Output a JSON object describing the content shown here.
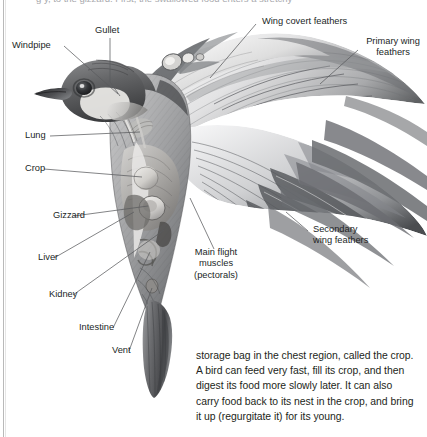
{
  "page": {
    "clipped_top_line": "g                y,                to the gizzard. First, the swallowed food enters a stretchy",
    "background_color": "#ffffff",
    "text_color": "#231f20"
  },
  "figure": {
    "name": "bird-internal-anatomy-diagram",
    "style": "pencil / graphite shaded scientific illustration, greyscale"
  },
  "labels": [
    {
      "id": "windpipe",
      "text": "Windpipe",
      "align": "left"
    },
    {
      "id": "gullet",
      "text": "Gullet",
      "align": "left"
    },
    {
      "id": "lung",
      "text": "Lung",
      "align": "left"
    },
    {
      "id": "crop",
      "text": "Crop",
      "align": "left"
    },
    {
      "id": "gizzard",
      "text": "Gizzard",
      "align": "left"
    },
    {
      "id": "liver",
      "text": "Liver",
      "align": "left"
    },
    {
      "id": "kidney",
      "text": "Kidney",
      "align": "left"
    },
    {
      "id": "intestine",
      "text": "Intestine",
      "align": "left"
    },
    {
      "id": "vent",
      "text": "Vent",
      "align": "left"
    },
    {
      "id": "wing-covert",
      "text": "Wing covert feathers",
      "align": "left"
    },
    {
      "id": "primary-wing",
      "text": "Primary wing\nfeathers",
      "align": "center"
    },
    {
      "id": "secondary-wing",
      "text": "Secondary\nwing feathers",
      "align": "left"
    },
    {
      "id": "main-flight",
      "text": "Main flight\nmuscles\n(pectorals)",
      "align": "center"
    }
  ],
  "body_text": {
    "lines": [
      "storage bag in the chest region, called the crop.",
      "A bird can feed very fast, fill its crop, and then",
      "digest its food more slowly later. It can also",
      "carry food back to its nest in the crop, and bring",
      "it up (regurgitate it) for its young."
    ]
  }
}
